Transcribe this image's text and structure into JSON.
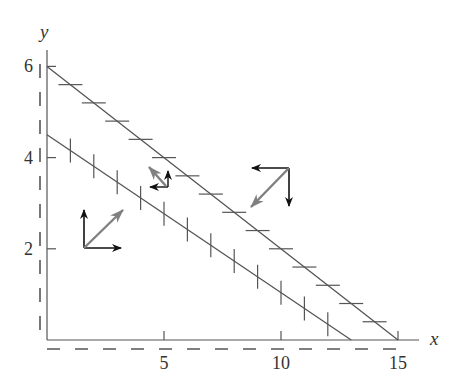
{
  "figure": {
    "type": "phase-plane"
  },
  "axes": {
    "x_label": "x",
    "y_label": "y",
    "x_ticks": [
      {
        "value": 5,
        "label": "5"
      },
      {
        "value": 10,
        "label": "10"
      },
      {
        "value": 15,
        "label": "15"
      }
    ],
    "y_ticks": [
      {
        "value": 2,
        "label": "2"
      },
      {
        "value": 4,
        "label": "4"
      },
      {
        "value": 6,
        "label": "6"
      }
    ],
    "x_range": [
      0,
      16
    ],
    "y_range": [
      0,
      6.6
    ],
    "dashed_margin_lines": true
  },
  "nullclines": [
    {
      "name": "upper-nullcline",
      "from": [
        0,
        6
      ],
      "to": [
        15,
        0
      ],
      "tick_orientation": "horizontal",
      "tick_x_positions": [
        1,
        2,
        3,
        4,
        5,
        6,
        7,
        8,
        9,
        10,
        11,
        12,
        13,
        14
      ]
    },
    {
      "name": "lower-nullcline",
      "from": [
        0,
        4.5
      ],
      "to": [
        13,
        0
      ],
      "tick_orientation": "vertical",
      "tick_x_positions": [
        1,
        2,
        3,
        4,
        5,
        6,
        7,
        8,
        9,
        10,
        11,
        12
      ]
    }
  ],
  "vector_groups": [
    {
      "name": "region-below-both",
      "origin_px": [
        84,
        248
      ],
      "components": [
        "up",
        "right"
      ],
      "resultant": "up-right"
    },
    {
      "name": "region-between",
      "origin_px": [
        168,
        187
      ],
      "components": [
        "up",
        "left"
      ],
      "resultant": "up-left"
    },
    {
      "name": "region-above-both",
      "origin_px": [
        289,
        168
      ],
      "components": [
        "down",
        "left"
      ],
      "resultant": "down-left"
    }
  ],
  "colors": {
    "axis": "#555555",
    "nullcline": "#555555",
    "component_arrow": "#111111",
    "resultant_arrow": "#808080",
    "text": "#333333"
  }
}
